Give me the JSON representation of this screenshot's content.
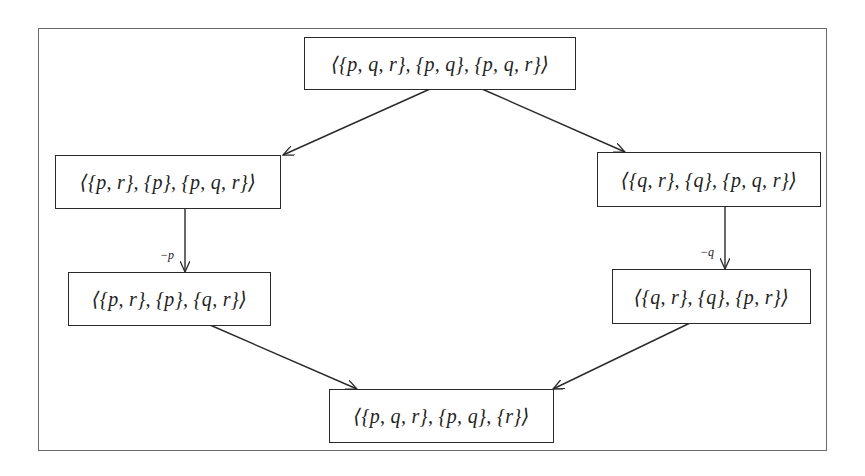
{
  "diagram": {
    "nodes": [
      {
        "id": "top",
        "label": "⟨{p, q, r}, {p, q}, {p, q, r}⟩"
      },
      {
        "id": "left-mid",
        "label": "⟨{p, r}, {p}, {p, q, r}⟩"
      },
      {
        "id": "right-mid",
        "label": "⟨{q, r}, {q}, {p, q, r}⟩"
      },
      {
        "id": "left-low",
        "label": "⟨{p, r}, {p}, {q, r}⟩"
      },
      {
        "id": "right-low",
        "label": "⟨{q, r}, {q}, {p, r}⟩"
      },
      {
        "id": "bottom",
        "label": "⟨{p, q, r}, {p, q}, {r}⟩"
      }
    ],
    "edges": [
      {
        "from": "top",
        "to": "left-mid",
        "label": ""
      },
      {
        "from": "top",
        "to": "right-mid",
        "label": ""
      },
      {
        "from": "left-mid",
        "to": "left-low",
        "label": "−p"
      },
      {
        "from": "right-mid",
        "to": "right-low",
        "label": "−q"
      },
      {
        "from": "left-low",
        "to": "bottom",
        "label": ""
      },
      {
        "from": "right-low",
        "to": "bottom",
        "label": ""
      }
    ],
    "colors": {
      "stroke": "#2a2a2a",
      "frame": "#6a6a6a",
      "background": "#ffffff"
    }
  }
}
